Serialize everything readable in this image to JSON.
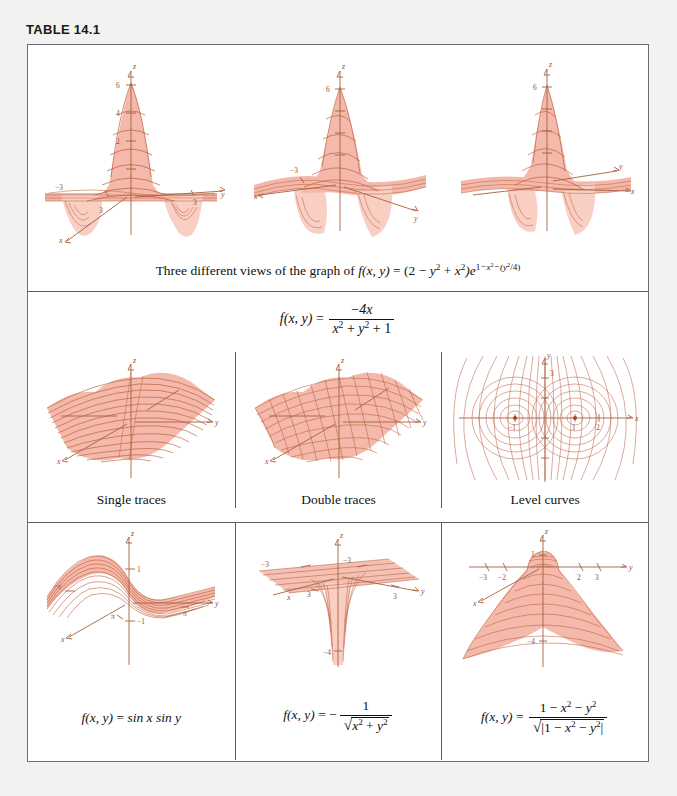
{
  "table": {
    "label": "TABLE 14.1"
  },
  "row1": {
    "caption": {
      "lead": "Three different views of the graph of",
      "fn": "f(x, y)",
      "eq": "=",
      "open": "(2",
      "minus": "−",
      "y2": "y",
      "plus": "+",
      "x2": "x",
      "close": ")e",
      "exp_one": "1",
      "exp_minus_x": "−x",
      "exp_minus_y": "−(y",
      "exp_tail": "/4)",
      "sup2": "2"
    },
    "plots": [
      {
        "name": "view-1",
        "axis_labels": {
          "x": "x",
          "y": "y",
          "z": "z"
        },
        "z_ticks": [
          "6",
          "4",
          "2"
        ],
        "plane_ticks": [
          "−3",
          "3",
          "3"
        ]
      },
      {
        "name": "view-2",
        "axis_labels": {
          "x": "x",
          "y": "y",
          "z": "z"
        },
        "z_ticks": [
          "6"
        ],
        "plane_ticks": [
          "−3"
        ]
      },
      {
        "name": "view-3",
        "axis_labels": {
          "x": "x",
          "y": "y",
          "z": "z"
        },
        "z_ticks": [
          "6"
        ],
        "plane_ticks": []
      }
    ]
  },
  "row2": {
    "formula": {
      "fn": "f(x, y)",
      "eq": "=",
      "numerator_sign": "−",
      "numerator": "4x",
      "den_x": "x",
      "den_plus1": "+",
      "den_y": "y",
      "den_plus2": "+",
      "den_one": "1",
      "sup2": "2"
    },
    "cells": [
      {
        "name": "single-traces",
        "caption": "Single traces",
        "axis_labels": {
          "x": "x",
          "y": "y",
          "z": "z"
        }
      },
      {
        "name": "double-traces",
        "caption": "Double traces",
        "axis_labels": {
          "x": "x",
          "y": "y",
          "z": "z"
        }
      },
      {
        "name": "level-curves",
        "caption": "Level curves",
        "axis_labels": {
          "x": "x",
          "y": "y"
        },
        "x_ticks": [
          "−1",
          "1",
          "2"
        ],
        "y_ticks": [
          "3"
        ]
      }
    ]
  },
  "row3": {
    "cells": [
      {
        "name": "sin-x-sin-y",
        "axis_labels": {
          "x": "x",
          "y": "y",
          "z": "z"
        },
        "z_ticks": [
          "1",
          "−1"
        ],
        "plane_ticks": [
          "−π",
          "π",
          "π"
        ],
        "formula": {
          "fn": "f(x, y)",
          "eq": "=",
          "body": "sin x sin y"
        }
      },
      {
        "name": "neg-inv-sqrt",
        "axis_labels": {
          "x": "x",
          "y": "y",
          "z": "z"
        },
        "z_ticks": [
          "−4"
        ],
        "plane_ticks": [
          "−3",
          "−3",
          "3",
          "3"
        ],
        "formula": {
          "fn": "f(x, y)",
          "eq": "=",
          "sign": "−",
          "num": "1",
          "den_x": "x",
          "den_plus": "+",
          "den_y": "y",
          "sup2": "2"
        }
      },
      {
        "name": "normalized-sphere",
        "axis_labels": {
          "x": "x",
          "y": "y",
          "z": "z"
        },
        "z_ticks": [
          "1",
          "−4"
        ],
        "y_ticks": [
          "−3",
          "−2",
          "2",
          "3"
        ],
        "formula": {
          "fn": "f(x, y)",
          "eq": "=",
          "num_one": "1",
          "num_minus1": "−",
          "num_x": "x",
          "num_minus2": "−",
          "num_y": "y",
          "den_one": "1",
          "den_minus1": "−",
          "den_x": "x",
          "den_minus2": "−",
          "den_y": "y",
          "sup2": "2"
        }
      }
    ]
  },
  "colors": {
    "surface_fill": "#f5b9ab",
    "surface_line": "#b4522f",
    "axis": "#a4613f",
    "frame_border": "#6e6e72",
    "page_background": "#f2f2f0"
  }
}
